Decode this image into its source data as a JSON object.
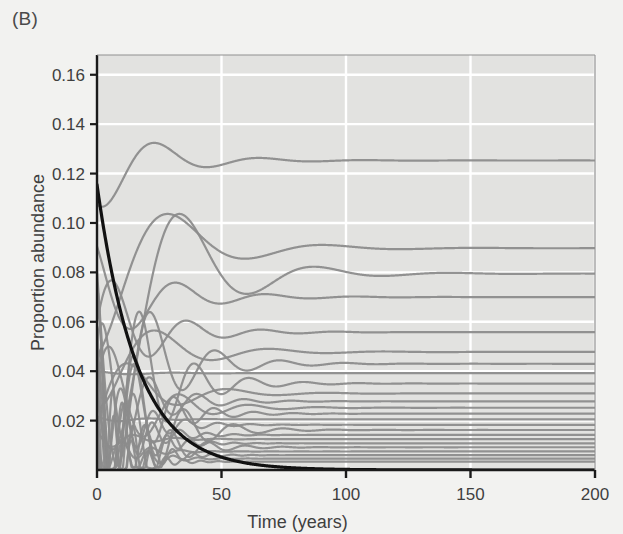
{
  "figure": {
    "panel_label": "(B)",
    "background_color": "#f2f2f0"
  },
  "chart_data": {
    "type": "line",
    "title": "",
    "panel": "(B)",
    "xlabel": "Time (years)",
    "ylabel": "Proportion abundance",
    "xlim": [
      0,
      200
    ],
    "ylim": [
      0,
      0.168
    ],
    "xticks": [
      0,
      50,
      100,
      150,
      200
    ],
    "xtick_labels": [
      "0",
      "50",
      "100",
      "150",
      "200"
    ],
    "yticks": [
      0.02,
      0.04,
      0.06,
      0.08,
      0.1,
      0.12,
      0.14,
      0.16
    ],
    "ytick_labels": [
      "0.02",
      "0.04",
      "0.06",
      "0.08",
      "0.10",
      "0.12",
      "0.14",
      "0.16"
    ],
    "grid": true,
    "grid_color": "#ffffff",
    "plot_bg": "#e2e2e0",
    "legend": "none",
    "axis_color": "#1a1a1a",
    "series_color": "#8c8c8c",
    "highlight_color": "#111111",
    "highlight_series": {
      "name": "focal species (extinction)",
      "color": "#111111",
      "width": 3.2,
      "start_value": 0.1155,
      "decay_rate": 0.062,
      "equilibrium": 0.0,
      "points": [
        [
          0,
          0.1155
        ],
        [
          5,
          0.0848
        ],
        [
          10,
          0.0622
        ],
        [
          15,
          0.0456
        ],
        [
          20,
          0.0335
        ],
        [
          25,
          0.0246
        ],
        [
          30,
          0.018
        ],
        [
          35,
          0.0132
        ],
        [
          40,
          0.0097
        ],
        [
          45,
          0.0071
        ],
        [
          50,
          0.0052
        ],
        [
          60,
          0.0028
        ],
        [
          70,
          0.0015
        ],
        [
          85,
          0.0006
        ],
        [
          100,
          0.0002
        ],
        [
          130,
          0.0001
        ],
        [
          160,
          0.0
        ],
        [
          200,
          0.0
        ]
      ]
    },
    "series": [
      {
        "name": "sp01",
        "color": "#8c8c8c",
        "start": 0.1075,
        "equilibrium": 0.1253,
        "amplitude": 0.03,
        "period": 42,
        "phase": 2.55,
        "damping": 0.046
      },
      {
        "name": "sp02",
        "color": "#8c8c8c",
        "start": 0.0465,
        "equilibrium": 0.0898,
        "amplitude": 0.044,
        "period": 62,
        "phase": 3.05,
        "damping": 0.038
      },
      {
        "name": "sp03",
        "color": "#8c8c8c",
        "start": 0.031,
        "equilibrium": 0.0795,
        "amplitude": 0.05,
        "period": 54,
        "phase": 2.1,
        "damping": 0.04
      },
      {
        "name": "sp04",
        "color": "#8c8c8c",
        "start": 0.0905,
        "equilibrium": 0.07,
        "amplitude": 0.038,
        "period": 36,
        "phase": 0.55,
        "damping": 0.044
      },
      {
        "name": "sp05",
        "color": "#8c8c8c",
        "start": 0.0595,
        "equilibrium": 0.0558,
        "amplitude": 0.042,
        "period": 30,
        "phase": 1.7,
        "damping": 0.05
      },
      {
        "name": "sp06",
        "color": "#8c8c8c",
        "start": 0.025,
        "equilibrium": 0.0478,
        "amplitude": 0.046,
        "period": 46,
        "phase": 2.85,
        "damping": 0.042
      },
      {
        "name": "sp07",
        "color": "#8c8c8c",
        "start": 0.0805,
        "equilibrium": 0.043,
        "amplitude": 0.04,
        "period": 26,
        "phase": 0.95,
        "damping": 0.052
      },
      {
        "name": "sp08",
        "color": "#8c8c8c",
        "start": 0.04,
        "equilibrium": 0.0392,
        "amplitude": 0.048,
        "period": 34,
        "phase": 3.5,
        "damping": 0.046
      },
      {
        "name": "sp09",
        "color": "#8c8c8c",
        "start": 0.069,
        "equilibrium": 0.035,
        "amplitude": 0.036,
        "period": 22,
        "phase": 1.25,
        "damping": 0.058
      },
      {
        "name": "sp10",
        "color": "#8c8c8c",
        "start": 0.018,
        "equilibrium": 0.031,
        "amplitude": 0.044,
        "period": 40,
        "phase": 4.1,
        "damping": 0.048
      },
      {
        "name": "sp11",
        "color": "#8c8c8c",
        "start": 0.052,
        "equilibrium": 0.0278,
        "amplitude": 0.038,
        "period": 19,
        "phase": 2.3,
        "damping": 0.062
      },
      {
        "name": "sp12",
        "color": "#8c8c8c",
        "start": 0.0345,
        "equilibrium": 0.0252,
        "amplitude": 0.042,
        "period": 28,
        "phase": 5.0,
        "damping": 0.054
      },
      {
        "name": "sp13",
        "color": "#8c8c8c",
        "start": 0.076,
        "equilibrium": 0.0228,
        "amplitude": 0.034,
        "period": 16,
        "phase": 0.3,
        "damping": 0.068
      },
      {
        "name": "sp14",
        "color": "#8c8c8c",
        "start": 0.0215,
        "equilibrium": 0.0205,
        "amplitude": 0.04,
        "period": 24,
        "phase": 3.8,
        "damping": 0.058
      },
      {
        "name": "sp15",
        "color": "#8c8c8c",
        "start": 0.061,
        "equilibrium": 0.0183,
        "amplitude": 0.03,
        "period": 13,
        "phase": 1.55,
        "damping": 0.074
      },
      {
        "name": "sp16",
        "color": "#8c8c8c",
        "start": 0.0285,
        "equilibrium": 0.0162,
        "amplitude": 0.036,
        "period": 20,
        "phase": 4.6,
        "damping": 0.064
      },
      {
        "name": "sp17",
        "color": "#8c8c8c",
        "start": 0.045,
        "equilibrium": 0.0142,
        "amplitude": 0.028,
        "period": 11,
        "phase": 2.95,
        "damping": 0.082
      },
      {
        "name": "sp18",
        "color": "#8c8c8c",
        "start": 0.016,
        "equilibrium": 0.0125,
        "amplitude": 0.032,
        "period": 17,
        "phase": 0.75,
        "damping": 0.07
      },
      {
        "name": "sp19",
        "color": "#8c8c8c",
        "start": 0.037,
        "equilibrium": 0.0108,
        "amplitude": 0.026,
        "period": 9,
        "phase": 5.4,
        "damping": 0.09
      },
      {
        "name": "sp20",
        "color": "#8c8c8c",
        "start": 0.0985,
        "equilibrium": 0.0092,
        "amplitude": 0.03,
        "period": 15,
        "phase": 3.2,
        "damping": 0.076
      },
      {
        "name": "sp21",
        "color": "#8c8c8c",
        "start": 0.013,
        "equilibrium": 0.0075,
        "amplitude": 0.024,
        "period": 12,
        "phase": 1.05,
        "damping": 0.088
      },
      {
        "name": "sp22",
        "color": "#8c8c8c",
        "start": 0.0545,
        "equilibrium": 0.006,
        "amplitude": 0.022,
        "period": 8,
        "phase": 4.35,
        "damping": 0.098
      },
      {
        "name": "sp23",
        "color": "#8c8c8c",
        "start": 0.0235,
        "equilibrium": 0.0046,
        "amplitude": 0.02,
        "period": 10,
        "phase": 2.65,
        "damping": 0.094
      },
      {
        "name": "sp24",
        "color": "#8c8c8c",
        "start": 0.042,
        "equilibrium": 0.0034,
        "amplitude": 0.018,
        "period": 7,
        "phase": 0.15,
        "damping": 0.11
      }
    ]
  }
}
